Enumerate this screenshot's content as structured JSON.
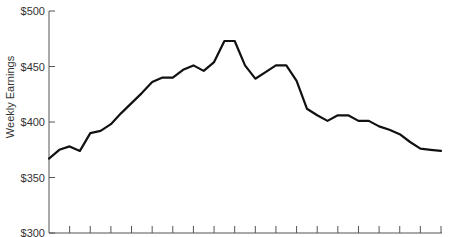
{
  "chart_data": {
    "type": "line",
    "title": "",
    "xlabel": "",
    "ylabel": "Weekly Earnings",
    "ylim": [
      300,
      500
    ],
    "yticks": [
      300,
      350,
      400,
      450,
      500
    ],
    "ytick_labels": [
      "$300",
      "$350",
      "$400",
      "$450",
      "$500"
    ],
    "x_tick_count": 19,
    "x_tick_labels": [],
    "grid": false,
    "legend": null,
    "series": [
      {
        "name": "Weekly Earnings",
        "color": "#111111",
        "values": [
          367,
          375,
          378,
          374,
          390,
          392,
          398,
          408,
          417,
          426,
          436,
          440,
          440,
          447,
          451,
          446,
          454,
          473,
          473,
          451,
          439,
          445,
          451,
          451,
          437,
          412,
          406,
          401,
          406,
          406,
          401,
          401,
          396,
          393,
          389,
          382,
          376,
          375,
          374
        ]
      }
    ]
  },
  "axes": {
    "y_title": "Weekly Earnings",
    "y_labels": [
      "$500",
      "$450",
      "$400",
      "$350",
      "$300"
    ]
  }
}
